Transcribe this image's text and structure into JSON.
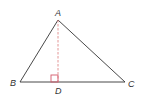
{
  "diagram": {
    "type": "triangle-with-altitude",
    "points": {
      "A": {
        "label": "A",
        "x": 58,
        "y": 20
      },
      "B": {
        "label": "B",
        "x": 20,
        "y": 82
      },
      "C": {
        "label": "C",
        "x": 125,
        "y": 82
      },
      "D": {
        "label": "D",
        "x": 58,
        "y": 82
      }
    },
    "segments": [
      {
        "from": "A",
        "to": "B",
        "style": "solid"
      },
      {
        "from": "A",
        "to": "C",
        "style": "solid"
      },
      {
        "from": "B",
        "to": "C",
        "style": "solid"
      },
      {
        "from": "A",
        "to": "D",
        "style": "dashed"
      }
    ],
    "right_angle_at": "D",
    "colors": {
      "stroke": "#333333",
      "altitude": "#e08a8a",
      "right_angle_marker": "#d45a6a"
    }
  }
}
